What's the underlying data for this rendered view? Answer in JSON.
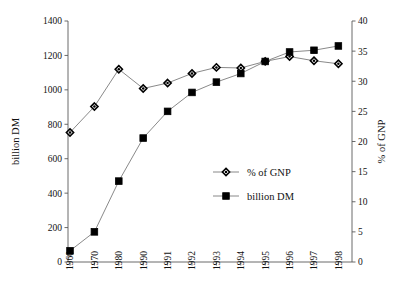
{
  "chart_data": {
    "type": "line",
    "title": "",
    "subtitle": "",
    "xlabel": "",
    "ylabel": "billion DM",
    "y2label": "% of GNP",
    "categories": [
      "1960",
      "1970",
      "1980",
      "1990",
      "1991",
      "1992",
      "1993",
      "1994",
      "1995",
      "1996",
      "1997",
      "1998"
    ],
    "ylim": [
      0,
      1400
    ],
    "y2lim": [
      0,
      40
    ],
    "yticks": [
      0,
      200,
      400,
      600,
      800,
      1000,
      1200,
      1400
    ],
    "y2ticks": [
      0,
      5,
      10,
      15,
      20,
      25,
      30,
      35,
      40
    ],
    "ytick_labels": [
      "0",
      "200",
      "400",
      "600",
      "800",
      "1000",
      "1200",
      "1400"
    ],
    "y2tick_labels": [
      "0",
      "5",
      "10",
      "15",
      "20",
      "25",
      "30",
      "35",
      "40"
    ],
    "grid": false,
    "legend_position": "center-right-inside",
    "series": [
      {
        "name": "% of GNP",
        "axis": "right",
        "marker": "diamond",
        "values": [
          21.5,
          25.8,
          32.0,
          28.8,
          29.7,
          31.3,
          32.3,
          32.2,
          33.3,
          34.1,
          33.4,
          32.9
        ]
      },
      {
        "name": "billion DM",
        "axis": "left",
        "marker": "square",
        "values": [
          65,
          175,
          470,
          720,
          875,
          985,
          1045,
          1095,
          1165,
          1220,
          1230,
          1255
        ]
      }
    ]
  },
  "axes": {
    "left_title": "billion DM",
    "right_title": "% of GNP"
  },
  "legend": {
    "items": [
      {
        "label": "% of GNP",
        "marker": "diamond"
      },
      {
        "label": "billion DM",
        "marker": "square"
      }
    ]
  },
  "colors": {
    "line": "#6b6b6b",
    "axis": "#5a5a5a",
    "marker_fill": "#000000",
    "background": "#ffffff",
    "text": "#111111"
  }
}
